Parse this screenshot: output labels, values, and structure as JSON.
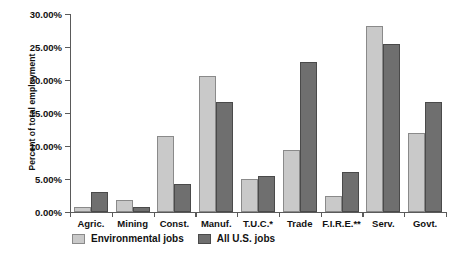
{
  "chart_data": {
    "type": "bar",
    "title": "",
    "xlabel": "",
    "ylabel": "Percent of total employment",
    "ylim": [
      0,
      30
    ],
    "ytick_values": [
      0,
      5,
      10,
      15,
      20,
      25,
      30
    ],
    "ytick_labels": [
      "0.00%",
      "5.00%",
      "10.00%",
      "15.00%",
      "20.00%",
      "25.00%",
      "30.00%"
    ],
    "grid": false,
    "legend_position": "bottom-left",
    "categories": [
      "Agric.",
      "Mining",
      "Const.",
      "Manuf.",
      "T.U.C.*",
      "Trade",
      "F.I.R.E.**",
      "Serv.",
      "Govt."
    ],
    "series": [
      {
        "name": "Environmental jobs",
        "color": "#c9c9c9",
        "edge_color": "#8a8a8a",
        "values": [
          0.7,
          1.8,
          11.5,
          20.6,
          5.0,
          9.4,
          2.4,
          28.2,
          12.0
        ]
      },
      {
        "name": "All U.S. jobs",
        "color": "#6f6f6f",
        "edge_color": "#4a4a4a",
        "values": [
          3.0,
          0.7,
          4.2,
          16.7,
          5.5,
          22.7,
          6.1,
          25.5,
          16.7
        ]
      }
    ]
  },
  "legend": {
    "items": [
      {
        "label": "Environmental jobs",
        "swatch": "light"
      },
      {
        "label": "All U.S. jobs",
        "swatch": "dark"
      }
    ]
  }
}
